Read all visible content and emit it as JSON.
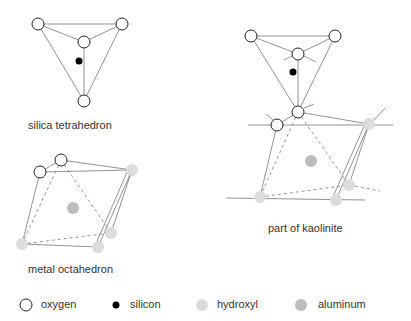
{
  "labels": {
    "tetrahedron": "silica tetrahedron",
    "octahedron": "metal octahedron",
    "kaolinite": "part of kaolinite"
  },
  "legend": [
    {
      "key": "oxygen",
      "label": "oxygen"
    },
    {
      "key": "silicon",
      "label": "silicon"
    },
    {
      "key": "hydroxyl",
      "label": "hydroxyl"
    },
    {
      "key": "aluminum",
      "label": "aluminum"
    }
  ],
  "colors": {
    "oxygen_stroke": "#222222",
    "silicon": "#000000",
    "hydroxyl": "#dcdcdc",
    "aluminum": "#bdbdbd",
    "line": "#777777"
  }
}
